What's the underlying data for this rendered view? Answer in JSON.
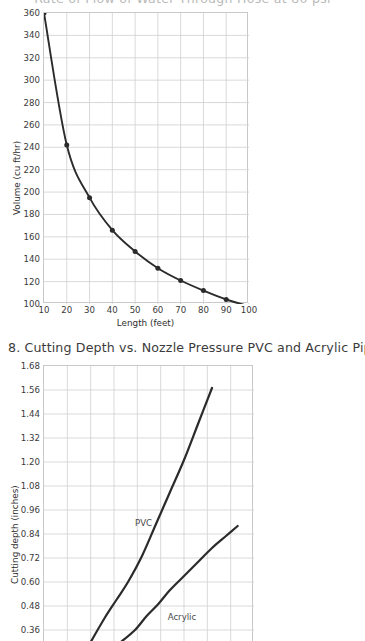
{
  "clipped_header": "Rate of Flow of Water Through Hose at 80 psi",
  "chart_data": [
    {
      "id": "flow",
      "type": "line",
      "title": "",
      "xlabel": "Length (feet)",
      "ylabel": "Volume (cu ft/hr)",
      "xlim": [
        10,
        100
      ],
      "ylim": [
        100,
        360
      ],
      "xticks": [
        10,
        20,
        30,
        40,
        50,
        60,
        70,
        80,
        90,
        100
      ],
      "yticks": [
        100,
        120,
        140,
        160,
        180,
        200,
        220,
        240,
        260,
        280,
        300,
        320,
        340,
        360
      ],
      "grid": true,
      "markers": true,
      "legend": "none",
      "x": [
        10,
        20,
        30,
        40,
        50,
        60,
        70,
        80,
        90,
        100
      ],
      "values": [
        360,
        242,
        195,
        166,
        147,
        132,
        121,
        112,
        104,
        98
      ],
      "line_color": "#2b2b2b",
      "grid_color": "#cfcfcf"
    },
    {
      "id": "cutting",
      "type": "line",
      "title": "8. Cutting Depth vs. Nozzle Pressure PVC and Acrylic Pipe",
      "xlabel": "",
      "ylabel": "Cutting depth (inches)",
      "ylim": [
        0.3,
        1.68
      ],
      "yticks": [
        0.36,
        0.48,
        0.6,
        0.72,
        0.84,
        0.96,
        1.08,
        1.2,
        1.32,
        1.44,
        1.56,
        1.68
      ],
      "ytick_labels": [
        "0.36",
        "0.48",
        "0.60",
        "0.72",
        "0.84",
        "0.96",
        "1.08",
        "1.20",
        "1.32",
        "1.44",
        "1.56",
        "1.68"
      ],
      "xlim": [
        0,
        9
      ],
      "xticks": [
        0,
        1,
        2,
        3,
        4,
        5,
        6,
        7,
        8,
        9
      ],
      "grid": true,
      "markers": false,
      "legend": "inline-labels",
      "series": [
        {
          "name": "PVC",
          "label": "PVC",
          "x": [
            2.0,
            2.6,
            3.1,
            3.6,
            4.2,
            4.8,
            5.4,
            6.0,
            6.6,
            7.2
          ],
          "values": [
            0.3,
            0.42,
            0.51,
            0.6,
            0.73,
            0.89,
            1.05,
            1.21,
            1.39,
            1.57
          ]
        },
        {
          "name": "Acrylic",
          "label": "Acrylic",
          "x": [
            3.3,
            3.9,
            4.4,
            4.9,
            5.4,
            6.0,
            6.6,
            7.2,
            7.8,
            8.3
          ],
          "values": [
            0.3,
            0.36,
            0.43,
            0.49,
            0.56,
            0.63,
            0.7,
            0.77,
            0.83,
            0.88
          ]
        }
      ],
      "line_color": "#2b2b2b",
      "grid_color": "#cfcfcf"
    }
  ]
}
